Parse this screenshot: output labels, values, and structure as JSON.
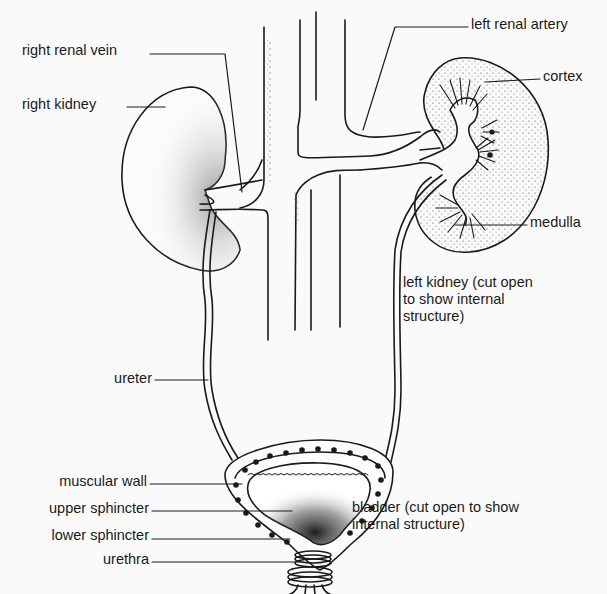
{
  "diagram": {
    "labels": {
      "right_renal_vein": "right renal vein",
      "right_kidney": "right kidney",
      "left_renal_artery": "left renal artery",
      "cortex": "cortex",
      "medulla": "medulla",
      "left_kidney_line1": "left kidney (cut open",
      "left_kidney_line2": "to show internal",
      "left_kidney_line3": "structure)",
      "ureter": "ureter",
      "muscular_wall": "muscular wall",
      "upper_sphincter": "upper sphincter",
      "lower_sphincter": "lower sphincter",
      "urethra": "urethra",
      "bladder_line1": "bladder (cut open to show",
      "bladder_line2": "internal structure)"
    },
    "colors": {
      "ink": "#1a1a1a",
      "background": "#fafafa"
    }
  }
}
